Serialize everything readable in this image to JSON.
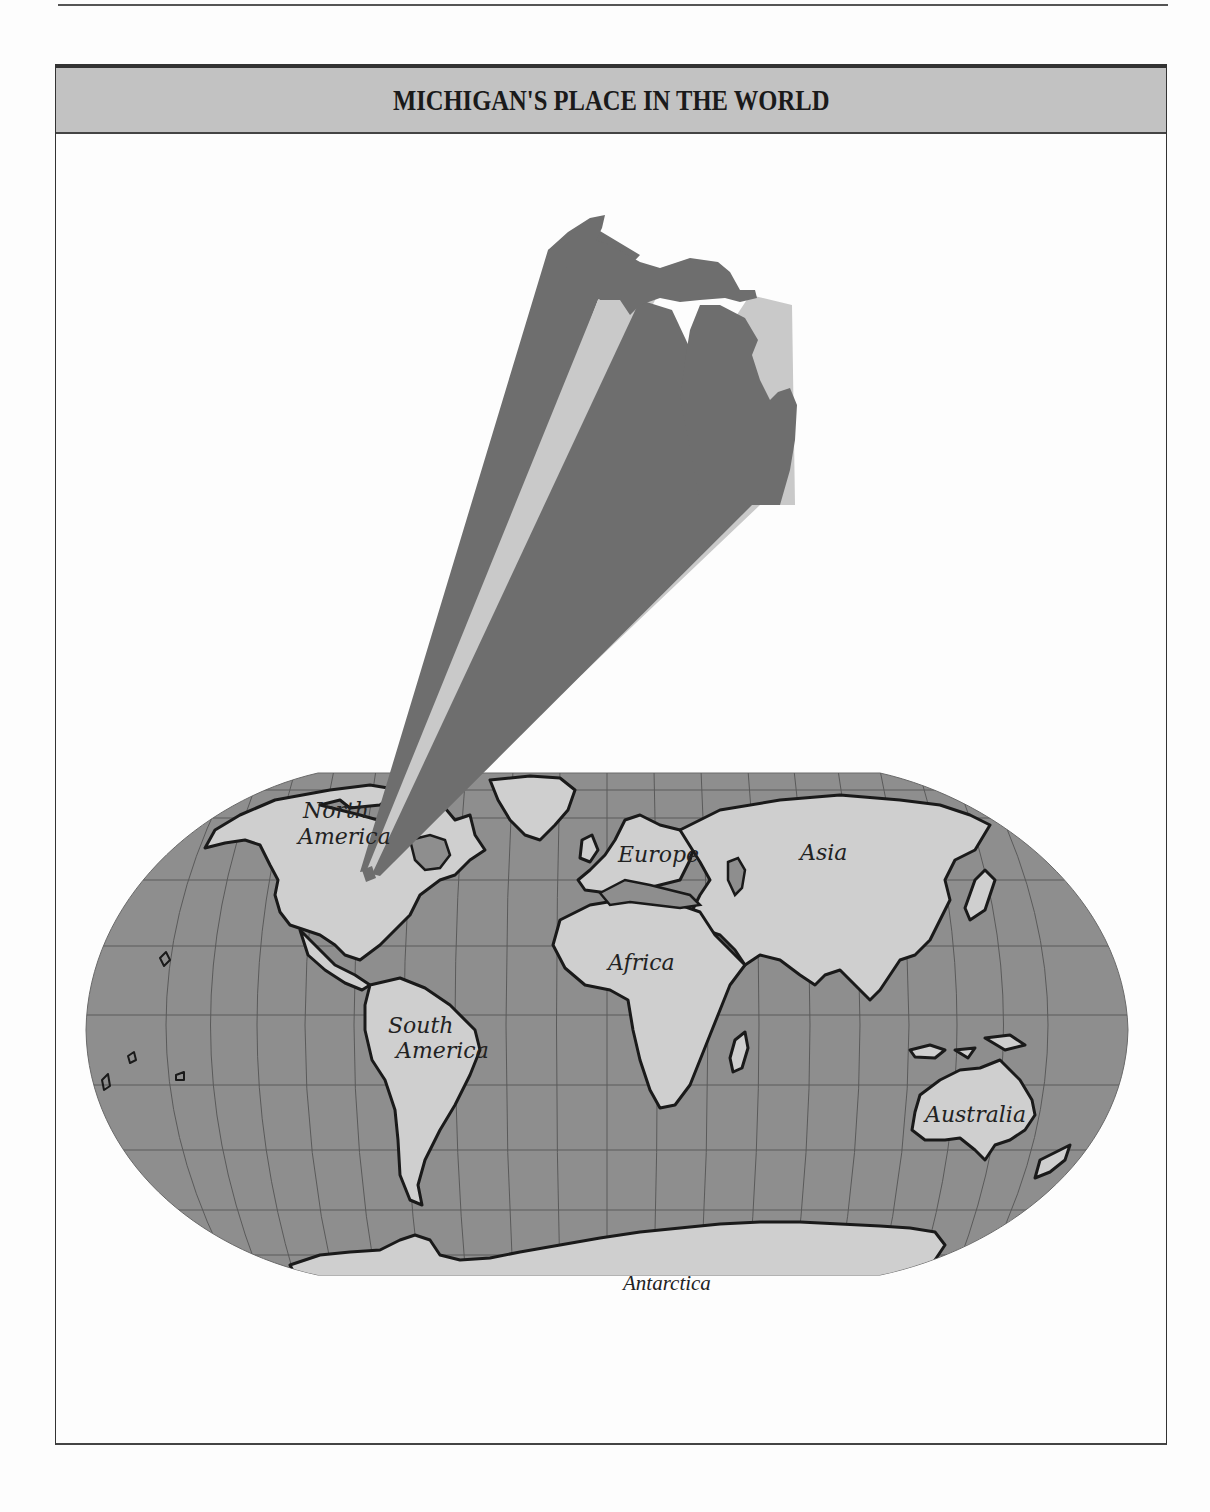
{
  "header": {
    "title": "MICHIGAN'S PLACE IN THE WORLD"
  },
  "map": {
    "projection": "robinson-style world map",
    "highlight": "Michigan (enlarged inset projected from Great Lakes region)",
    "labels": {
      "north_america_1": "North",
      "north_america_2": "America",
      "south_america_1": "South",
      "south_america_2": "America",
      "europe": "Europe",
      "asia": "Asia",
      "africa": "Africa",
      "australia": "Australia",
      "antarctica": "Antarctica"
    },
    "colors": {
      "ocean": "#8e8e8e",
      "land": "#cfcfcf",
      "michigan_dark": "#6e6e6e",
      "beam_light": "#c9c9c9",
      "coastline": "#1a1a1a",
      "graticule": "#5a5a5a",
      "title_band": "#c2c2c2"
    }
  }
}
